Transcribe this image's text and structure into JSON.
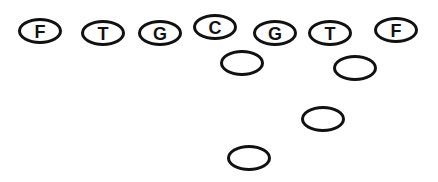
{
  "diagram": {
    "type": "football-formation",
    "line_color": "#111111",
    "offensive_line": [
      {
        "label": "F",
        "cx": 40,
        "cy": 31
      },
      {
        "label": "T",
        "cx": 103,
        "cy": 33
      },
      {
        "label": "G",
        "cx": 160,
        "cy": 33
      },
      {
        "label": "C",
        "cx": 215,
        "cy": 27
      },
      {
        "label": "G",
        "cx": 275,
        "cy": 33
      },
      {
        "label": "T",
        "cx": 330,
        "cy": 33
      },
      {
        "label": "F",
        "cx": 396,
        "cy": 30
      }
    ],
    "backs": [
      {
        "label": "",
        "cx": 242,
        "cy": 63
      },
      {
        "label": "",
        "cx": 355,
        "cy": 68
      },
      {
        "label": "",
        "cx": 323,
        "cy": 119
      },
      {
        "label": "",
        "cx": 249,
        "cy": 158
      }
    ]
  }
}
